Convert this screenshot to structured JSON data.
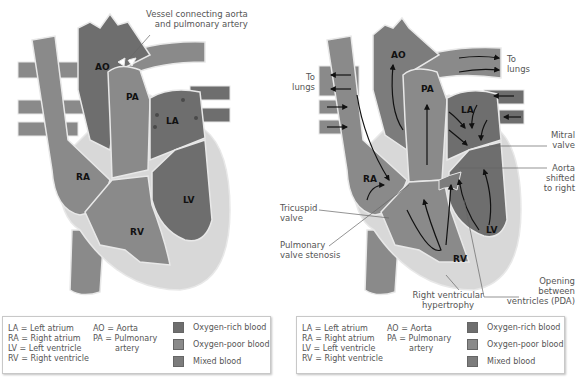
{
  "colors": {
    "oxygen_rich": "#6e6e6e",
    "oxygen_poor": "#8a8a8a",
    "mixed": "#7c7c7c",
    "wall": "#d8d8d8",
    "outline": "#e8e8e8",
    "background": "#ffffff"
  },
  "left": {
    "chamber_labels": {
      "ao": "AO",
      "pa": "PA",
      "la": "LA",
      "ra": "RA",
      "lv": "LV",
      "rv": "RV"
    },
    "annotation": {
      "line1": "Vessel connecting aorta",
      "line2": "and pulmonary artery"
    }
  },
  "right": {
    "chamber_labels": {
      "ao": "AO",
      "pa": "PA",
      "la": "LA",
      "ra": "RA",
      "lv": "LV",
      "rv": "RV"
    },
    "annotations": {
      "to_lungs_left": {
        "line1": "To",
        "line2": "lungs"
      },
      "to_lungs_right": {
        "line1": "To",
        "line2": "lungs"
      },
      "mitral_valve": {
        "line1": "Mitral",
        "line2": "valve"
      },
      "aorta_shifted": {
        "line1": "Aorta",
        "line2": "shifted",
        "line3": "to right"
      },
      "tricuspid_valve": {
        "line1": "Tricuspid",
        "line2": "valve"
      },
      "pulmonary_stenosis": {
        "line1": "Pulmonary",
        "line2": "valve stenosis"
      },
      "rv_hypertrophy": {
        "line1": "Right ventricular",
        "line2": "hypertrophy"
      },
      "opening_between": {
        "line1": "Opening",
        "line2": "between",
        "line3": "ventricles (PDA)"
      }
    }
  },
  "legend": {
    "abbrev_col1": [
      "LA  = Left atrium",
      "RA  = Right atrium",
      "LV  = Left ventricle",
      "RV  = Right ventricle"
    ],
    "abbrev_col2": [
      "AO = Aorta",
      "PA  = Pulmonary",
      "        artery"
    ],
    "swatches": [
      {
        "label": "Oxygen-rich blood"
      },
      {
        "label": "Oxygen-poor blood"
      },
      {
        "label": "Mixed blood"
      }
    ]
  }
}
